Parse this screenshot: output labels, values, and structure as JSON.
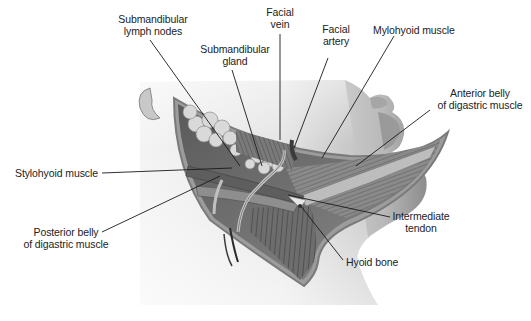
{
  "figure": {
    "colors": {
      "background": "#ffffff",
      "skin_light": "#e9e9e9",
      "skin_dark": "#9a9a9a",
      "muscle": "#6f6f6f",
      "gland": "#d4d4d4",
      "leader_line": "#1a1a1a",
      "label_text": "#222222"
    },
    "labels": {
      "submandibular_lymph_nodes": {
        "line1": "Submandibular",
        "line2": "lymph nodes"
      },
      "submandibular_gland": {
        "line1": "Submandibular",
        "line2": "gland"
      },
      "facial_vein": {
        "line1": "Facial",
        "line2": "vein"
      },
      "facial_artery": {
        "line1": "Facial",
        "line2": "artery"
      },
      "mylohyoid_muscle": {
        "line1": "Mylohyoid muscle"
      },
      "anterior_belly": {
        "line1": "Anterior belly",
        "line2": "of digastric muscle"
      },
      "stylohyoid_muscle": {
        "line1": "Stylohyoid muscle"
      },
      "posterior_belly": {
        "line1": "Posterior belly",
        "line2": "of digastric muscle"
      },
      "intermediate_tendon": {
        "line1": "Intermediate",
        "line2": "tendon"
      },
      "hyoid_bone": {
        "line1": "Hyoid bone"
      }
    }
  }
}
